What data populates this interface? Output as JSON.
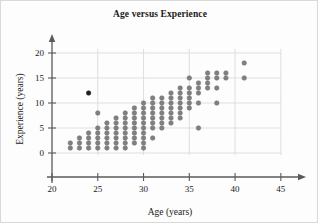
{
  "figure": {
    "title": "Age versus Experience",
    "background_color": "#fdfdfd",
    "border_color": "#d9d9d9"
  },
  "chart_data": {
    "type": "scatter",
    "title": "Age versus Experience",
    "xlabel": "Age (years)",
    "ylabel": "Experience (years)",
    "xlim": [
      20,
      46
    ],
    "ylim": [
      -3,
      21
    ],
    "xticks": [
      20,
      25,
      30,
      35,
      40,
      45
    ],
    "yticks": [
      0,
      5,
      10,
      15,
      20
    ],
    "grid": true,
    "grid_color": "#d7d7d7",
    "axis_color": "#5a5a5a",
    "marker_color": "#808080",
    "marker_edge_color": "#6e6e6e",
    "highlight_marker_color": "#1f1f1f",
    "marker_size": 4.6,
    "legend": null,
    "annotations": [
      {
        "label": "outlier",
        "x": 24,
        "y": 12,
        "color": "#1f1f1f",
        "note": "single dark-filled point well above the main trend"
      }
    ],
    "points": [
      {
        "x": 22,
        "y": 1
      },
      {
        "x": 22,
        "y": 2
      },
      {
        "x": 23,
        "y": 1
      },
      {
        "x": 23,
        "y": 2
      },
      {
        "x": 23,
        "y": 3
      },
      {
        "x": 24,
        "y": 1
      },
      {
        "x": 24,
        "y": 2
      },
      {
        "x": 24,
        "y": 3
      },
      {
        "x": 24,
        "y": 4
      },
      {
        "x": 24,
        "y": 12
      },
      {
        "x": 25,
        "y": 1
      },
      {
        "x": 25,
        "y": 2
      },
      {
        "x": 25,
        "y": 3
      },
      {
        "x": 25,
        "y": 4
      },
      {
        "x": 25,
        "y": 5
      },
      {
        "x": 25,
        "y": 8
      },
      {
        "x": 26,
        "y": 1
      },
      {
        "x": 26,
        "y": 2
      },
      {
        "x": 26,
        "y": 3
      },
      {
        "x": 26,
        "y": 4
      },
      {
        "x": 26,
        "y": 5
      },
      {
        "x": 26,
        "y": 6
      },
      {
        "x": 27,
        "y": 1
      },
      {
        "x": 27,
        "y": 2
      },
      {
        "x": 27,
        "y": 3
      },
      {
        "x": 27,
        "y": 4
      },
      {
        "x": 27,
        "y": 5
      },
      {
        "x": 27,
        "y": 6
      },
      {
        "x": 27,
        "y": 7
      },
      {
        "x": 28,
        "y": 1
      },
      {
        "x": 28,
        "y": 2
      },
      {
        "x": 28,
        "y": 3
      },
      {
        "x": 28,
        "y": 4
      },
      {
        "x": 28,
        "y": 5
      },
      {
        "x": 28,
        "y": 6
      },
      {
        "x": 28,
        "y": 7
      },
      {
        "x": 28,
        "y": 8
      },
      {
        "x": 29,
        "y": 2
      },
      {
        "x": 29,
        "y": 3
      },
      {
        "x": 29,
        "y": 4
      },
      {
        "x": 29,
        "y": 5
      },
      {
        "x": 29,
        "y": 6
      },
      {
        "x": 29,
        "y": 7
      },
      {
        "x": 29,
        "y": 8
      },
      {
        "x": 29,
        "y": 9
      },
      {
        "x": 30,
        "y": 1
      },
      {
        "x": 30,
        "y": 2
      },
      {
        "x": 30,
        "y": 3
      },
      {
        "x": 30,
        "y": 4
      },
      {
        "x": 30,
        "y": 5
      },
      {
        "x": 30,
        "y": 6
      },
      {
        "x": 30,
        "y": 7
      },
      {
        "x": 30,
        "y": 8
      },
      {
        "x": 30,
        "y": 9
      },
      {
        "x": 30,
        "y": 10
      },
      {
        "x": 31,
        "y": 3
      },
      {
        "x": 31,
        "y": 5
      },
      {
        "x": 31,
        "y": 6
      },
      {
        "x": 31,
        "y": 7
      },
      {
        "x": 31,
        "y": 8
      },
      {
        "x": 31,
        "y": 9
      },
      {
        "x": 31,
        "y": 10
      },
      {
        "x": 31,
        "y": 11
      },
      {
        "x": 32,
        "y": 5
      },
      {
        "x": 32,
        "y": 6
      },
      {
        "x": 32,
        "y": 7
      },
      {
        "x": 32,
        "y": 8
      },
      {
        "x": 32,
        "y": 9
      },
      {
        "x": 32,
        "y": 10
      },
      {
        "x": 32,
        "y": 11
      },
      {
        "x": 33,
        "y": 6
      },
      {
        "x": 33,
        "y": 7
      },
      {
        "x": 33,
        "y": 8
      },
      {
        "x": 33,
        "y": 9
      },
      {
        "x": 33,
        "y": 10
      },
      {
        "x": 33,
        "y": 11
      },
      {
        "x": 33,
        "y": 12
      },
      {
        "x": 34,
        "y": 7
      },
      {
        "x": 34,
        "y": 8
      },
      {
        "x": 34,
        "y": 9
      },
      {
        "x": 34,
        "y": 10
      },
      {
        "x": 34,
        "y": 11
      },
      {
        "x": 34,
        "y": 12
      },
      {
        "x": 34,
        "y": 13
      },
      {
        "x": 35,
        "y": 9
      },
      {
        "x": 35,
        "y": 10
      },
      {
        "x": 35,
        "y": 11
      },
      {
        "x": 35,
        "y": 12
      },
      {
        "x": 35,
        "y": 13
      },
      {
        "x": 35,
        "y": 15
      },
      {
        "x": 36,
        "y": 5
      },
      {
        "x": 36,
        "y": 10
      },
      {
        "x": 36,
        "y": 12
      },
      {
        "x": 36,
        "y": 13
      },
      {
        "x": 36,
        "y": 14
      },
      {
        "x": 37,
        "y": 13
      },
      {
        "x": 37,
        "y": 14
      },
      {
        "x": 37,
        "y": 15
      },
      {
        "x": 37,
        "y": 16
      },
      {
        "x": 38,
        "y": 10
      },
      {
        "x": 38,
        "y": 13
      },
      {
        "x": 38,
        "y": 15
      },
      {
        "x": 38,
        "y": 16
      },
      {
        "x": 39,
        "y": 15
      },
      {
        "x": 39,
        "y": 16
      },
      {
        "x": 41,
        "y": 15
      },
      {
        "x": 41,
        "y": 18
      }
    ]
  }
}
